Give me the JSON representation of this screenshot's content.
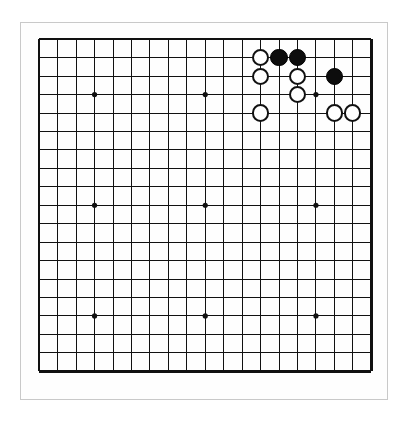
{
  "app": {
    "title": "Go Board",
    "board_type": "go-goban"
  },
  "board": {
    "size": 19,
    "columns": 19,
    "rows": 19,
    "cell_px": 18.45,
    "origin_x_px": 38,
    "origin_y_px": 38,
    "line_color": "#111111",
    "edge_line_color": "#111111",
    "background_color": "#ffffff",
    "outer_frame_color": "#c9c9c9",
    "star_point_lines": [
      3,
      9,
      15
    ],
    "star_points": [
      {
        "col": 3,
        "row": 3
      },
      {
        "col": 9,
        "row": 3
      },
      {
        "col": 15,
        "row": 3
      },
      {
        "col": 3,
        "row": 9
      },
      {
        "col": 9,
        "row": 9
      },
      {
        "col": 15,
        "row": 9
      },
      {
        "col": 3,
        "row": 15
      },
      {
        "col": 9,
        "row": 15
      },
      {
        "col": 15,
        "row": 15
      }
    ],
    "star_point_radius_px": 2.6,
    "stone_radius_px": 8.6
  },
  "stones": {
    "black_color": "#0d0d0d",
    "white_color": "#ffffff",
    "white_outline_color": "#111111",
    "black_count": 3,
    "white_count": 7,
    "total_count": 10,
    "list": [
      {
        "color": "white",
        "col": 12,
        "row": 1
      },
      {
        "color": "black",
        "col": 13,
        "row": 1
      },
      {
        "color": "black",
        "col": 14,
        "row": 1
      },
      {
        "color": "white",
        "col": 12,
        "row": 2
      },
      {
        "color": "white",
        "col": 14,
        "row": 2
      },
      {
        "color": "black",
        "col": 16,
        "row": 2
      },
      {
        "color": "white",
        "col": 14,
        "row": 3
      },
      {
        "color": "white",
        "col": 12,
        "row": 4
      },
      {
        "color": "white",
        "col": 16,
        "row": 4
      },
      {
        "color": "white",
        "col": 17,
        "row": 4
      }
    ]
  }
}
